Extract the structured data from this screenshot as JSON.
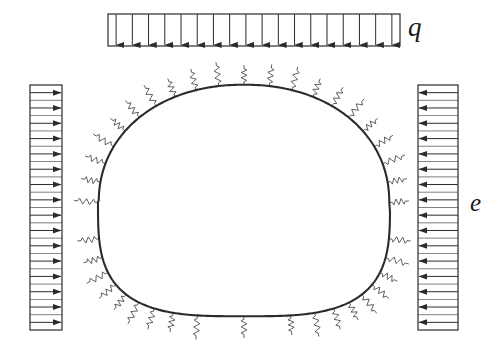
{
  "figure": {
    "type": "engineering-diagram",
    "background_color": "#ffffff",
    "line_color": "#2b2b2b",
    "spring_color": "#555555"
  },
  "labels": {
    "vertical_load": "q",
    "lateral_load": "e"
  },
  "loads": {
    "vertical": {
      "name": "uniform-vertical-surcharge",
      "symbol": "q",
      "direction": "down",
      "arrow_count": 18,
      "block": {
        "x": 108,
        "y": 14,
        "width": 292,
        "height": 32
      }
    },
    "lateral_left": {
      "name": "uniform-lateral-pressure-left",
      "symbol": "e",
      "direction": "right",
      "arrow_count": 16,
      "block": {
        "x": 30,
        "y": 85,
        "width": 32,
        "height": 245
      }
    },
    "lateral_right": {
      "name": "uniform-lateral-pressure-right",
      "symbol": "e",
      "direction": "left",
      "arrow_count": 16,
      "block": {
        "x": 418,
        "y": 85,
        "width": 40,
        "height": 245
      }
    }
  },
  "tunnel": {
    "name": "tunnel-lining-outline",
    "shape": "horseshoe-dome",
    "bounds": {
      "left": 98,
      "top": 87,
      "right": 390,
      "bottom": 318
    },
    "spring_count": 40,
    "spring_label": "elastic-ground-spring"
  }
}
